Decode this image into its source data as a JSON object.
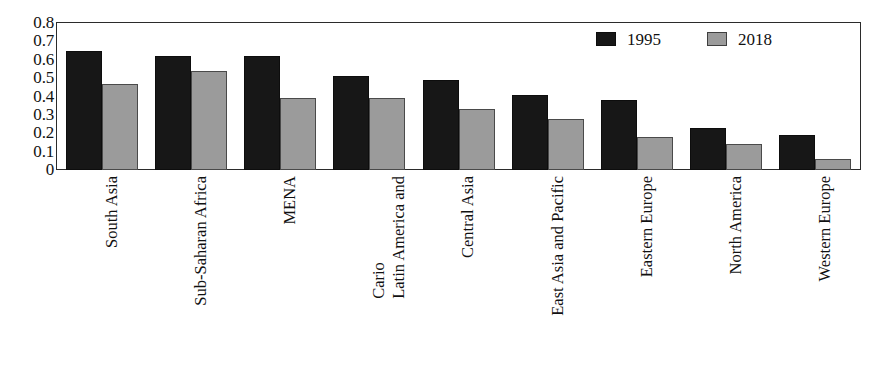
{
  "chart_data": {
    "type": "bar",
    "title": "",
    "xlabel": "",
    "ylabel": "",
    "ylim": [
      0,
      0.8
    ],
    "grid": false,
    "legend_position": "top-right",
    "y_ticks": [
      "0.8",
      "0.7",
      "0.6",
      "0.5",
      "0.4",
      "0.3",
      "0.2",
      "0.1",
      "0"
    ],
    "y_tick_values": [
      0.8,
      0.7,
      0.6,
      0.5,
      0.4,
      0.3,
      0.2,
      0.1,
      0
    ],
    "categories": [
      "South Asia",
      "Sub-Saharan Africa",
      "MENA",
      "Latin America and Cario",
      "Central Asia",
      "East Asia and Pacific",
      "Eastern Europe",
      "North America",
      "Western Europe"
    ],
    "category_lines": [
      [
        "South Asia"
      ],
      [
        "Sub-Saharan Africa"
      ],
      [
        "MENA"
      ],
      [
        "Latin America and",
        "Cario"
      ],
      [
        "Central Asia"
      ],
      [
        "East Asia and Pacific"
      ],
      [
        "Eastern Europe"
      ],
      [
        "North America"
      ],
      [
        "Western Europe"
      ]
    ],
    "series": [
      {
        "name": "1995",
        "color": "#171717",
        "values": [
          0.65,
          0.62,
          0.62,
          0.51,
          0.49,
          0.41,
          0.38,
          0.23,
          0.19
        ]
      },
      {
        "name": "2018",
        "color": "#9b9b9b",
        "values": [
          0.47,
          0.54,
          0.39,
          0.39,
          0.33,
          0.28,
          0.18,
          0.14,
          0.06
        ]
      }
    ]
  },
  "legend": {
    "entries": [
      {
        "label": "1995",
        "swatch": "black-square-swatch"
      },
      {
        "label": "2018",
        "swatch": "gray-square-swatch"
      }
    ]
  }
}
